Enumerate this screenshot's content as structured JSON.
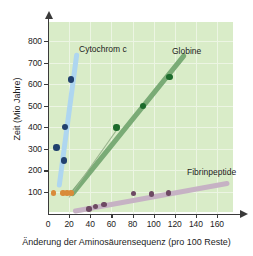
{
  "chart_data": {
    "type": "scatter",
    "title": "",
    "xlabel": "Änderung der Aminosäurensequenz (pro 100 Reste)",
    "ylabel": "Zeit (Mio Jahre)",
    "xlim": [
      0,
      175
    ],
    "ylim": [
      0,
      880
    ],
    "xticks": [
      0,
      20,
      40,
      60,
      80,
      100,
      120,
      140,
      160
    ],
    "yticks": [
      100,
      200,
      300,
      400,
      500,
      600,
      700,
      800
    ],
    "grid": true,
    "legend_position": "inline-annotations",
    "series": [
      {
        "name": "Cytochrom c",
        "color": "#20406e",
        "band_color": "#aed6f0",
        "points": [
          {
            "x": 8,
            "y": 307
          },
          {
            "x": 15,
            "y": 245
          },
          {
            "x": 16,
            "y": 400
          },
          {
            "x": 22,
            "y": 622
          }
        ],
        "trend": {
          "x1": 10,
          "y1": 120,
          "x2": 27,
          "y2": 745
        }
      },
      {
        "name": "Globine",
        "color": "#1d6b2c",
        "band_color": "#7aab76",
        "points": [
          {
            "x": 65,
            "y": 398
          },
          {
            "x": 90,
            "y": 498
          },
          {
            "x": 115,
            "y": 632
          }
        ],
        "trend": {
          "x1": 22,
          "y1": 85,
          "x2": 130,
          "y2": 740
        }
      },
      {
        "name": "Fibrinpeptide",
        "color": "#6d4a63",
        "band_color": "#c6b2c4",
        "points": [
          {
            "x": 39,
            "y": 22
          },
          {
            "x": 45,
            "y": 32
          },
          {
            "x": 53,
            "y": 42
          },
          {
            "x": 81,
            "y": 92
          },
          {
            "x": 98,
            "y": 90
          },
          {
            "x": 114,
            "y": 95
          }
        ],
        "trend": {
          "x1": 24,
          "y1": 8,
          "x2": 172,
          "y2": 140
        }
      },
      {
        "name": "orange-markers",
        "color": "#d98b3a",
        "points": [
          {
            "x": 5,
            "y": 95
          },
          {
            "x": 14,
            "y": 95
          },
          {
            "x": 18,
            "y": 95
          },
          {
            "x": 22,
            "y": 95
          }
        ]
      }
    ]
  },
  "annotations": {
    "cytochrom": "Cytochrom c",
    "globine": "Globine",
    "fibrinpeptide": "Fibrinpeptide"
  },
  "axis": {
    "x_title": "Änderung der Aminosäurensequenz (pro 100 Reste)",
    "y_title": "Zeit (Mio Jahre)"
  },
  "colors": {
    "plot_background": "#d9ecc8",
    "grid": "#ecf5e3",
    "axis": "#3a3a3a"
  }
}
